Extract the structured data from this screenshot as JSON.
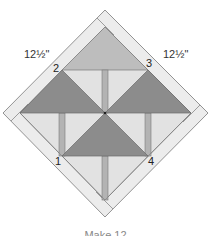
{
  "diagram": {
    "dimension_labels": {
      "left": "12½\"",
      "right": "12½\""
    },
    "corner_numbers": [
      "1",
      "2",
      "3",
      "4"
    ],
    "caption": "Make 12",
    "colors": {
      "border": "#e6e6e6",
      "background": "#e4e4e4",
      "light_triangle": "#bdbdbd",
      "dark_triangle": "#8c8c8c",
      "stem": "#b0b0b0",
      "outline": "#707070"
    }
  }
}
